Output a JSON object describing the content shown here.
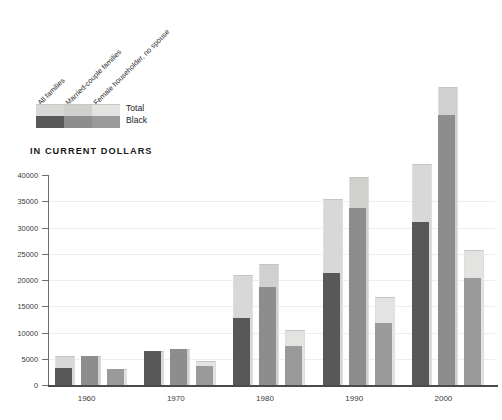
{
  "chart_title": "IN CURRENT DOLLARS",
  "legend": {
    "category_labels": [
      "All families",
      "Married-couple families",
      "Female householder, no spouse"
    ],
    "row_labels": [
      "Total",
      "Black"
    ],
    "total_colors": [
      "#d8d8d6",
      "#d0d0ce",
      "#e3e3e1"
    ],
    "black_colors": [
      "#585858",
      "#8d8d8d",
      "#9a9a9a"
    ]
  },
  "chart_data": {
    "type": "bar",
    "title": "IN CURRENT DOLLARS",
    "xlabel": "",
    "ylabel": "",
    "ylim": [
      0,
      40000
    ],
    "yticks": [
      0,
      5000,
      10000,
      15000,
      20000,
      25000,
      30000,
      35000,
      40000
    ],
    "ytick_labels": [
      "0",
      "5000",
      "10000",
      "15000",
      "20000",
      "25000",
      "30000",
      "35000",
      "40000"
    ],
    "grid": true,
    "legend_position": "top-left",
    "categories": [
      "1960",
      "1970",
      "1980",
      "1990",
      "2000"
    ],
    "group_labels": [
      "All families",
      "Married-couple families",
      "Female householder, no spouse"
    ],
    "series": [
      {
        "name": "All families - Total",
        "values": [
          5620,
          6570,
          21020,
          35350,
          42150
        ]
      },
      {
        "name": "All families - Black",
        "values": [
          3230,
          6520,
          12670,
          21420,
          30980
        ]
      },
      {
        "name": "Married-couple families - Total",
        "values": [
          5620,
          6950,
          23140,
          39580,
          56820
        ]
      },
      {
        "name": "Married-couple families - Black",
        "values": [
          5620,
          6950,
          18590,
          33780,
          51520
        ]
      },
      {
        "name": "Female householder, no spouse - Total",
        "values": [
          2970,
          4510,
          10410,
          16690,
          25790
        ]
      },
      {
        "name": "Female householder, no spouse - Black",
        "values": [
          2970,
          3570,
          7430,
          11890,
          20450
        ]
      }
    ]
  },
  "axis": {
    "x_tick_labels": [
      "1960",
      "1970",
      "1980",
      "1990",
      "2000"
    ]
  }
}
